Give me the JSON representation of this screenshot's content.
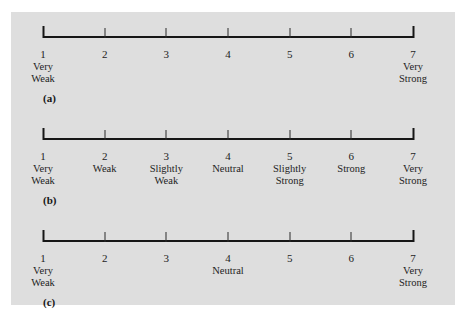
{
  "figure": {
    "background_color": "#dedede",
    "page_color": "#ffffff",
    "line_color": "#161616",
    "text_color": "#1d1d1d"
  },
  "scales": [
    {
      "panel_label": "(a)",
      "panel_top": 12,
      "label_top": 80,
      "points": [
        {
          "number": "1",
          "words": [
            "Very",
            "Weak"
          ]
        },
        {
          "number": "2",
          "words": []
        },
        {
          "number": "3",
          "words": []
        },
        {
          "number": "4",
          "words": []
        },
        {
          "number": "5",
          "words": []
        },
        {
          "number": "6",
          "words": []
        },
        {
          "number": "7",
          "words": [
            "Very",
            "Strong"
          ]
        }
      ]
    },
    {
      "panel_label": "(b)",
      "panel_top": 114,
      "label_top": 182,
      "points": [
        {
          "number": "1",
          "words": [
            "Very",
            "Weak"
          ]
        },
        {
          "number": "2",
          "words": [
            "Weak"
          ]
        },
        {
          "number": "3",
          "words": [
            "Slightly",
            "Weak"
          ]
        },
        {
          "number": "4",
          "words": [
            "Neutral"
          ]
        },
        {
          "number": "5",
          "words": [
            "Slightly",
            "Strong"
          ]
        },
        {
          "number": "6",
          "words": [
            "Strong"
          ]
        },
        {
          "number": "7",
          "words": [
            "Very",
            "Strong"
          ]
        }
      ]
    },
    {
      "panel_label": "(c)",
      "panel_top": 216,
      "label_top": 284,
      "points": [
        {
          "number": "1",
          "words": [
            "Very",
            "Weak"
          ]
        },
        {
          "number": "2",
          "words": []
        },
        {
          "number": "3",
          "words": []
        },
        {
          "number": "4",
          "words": [
            "Neutral"
          ]
        },
        {
          "number": "5",
          "words": []
        },
        {
          "number": "6",
          "words": []
        },
        {
          "number": "7",
          "words": [
            "Very",
            "Strong"
          ]
        }
      ]
    }
  ]
}
